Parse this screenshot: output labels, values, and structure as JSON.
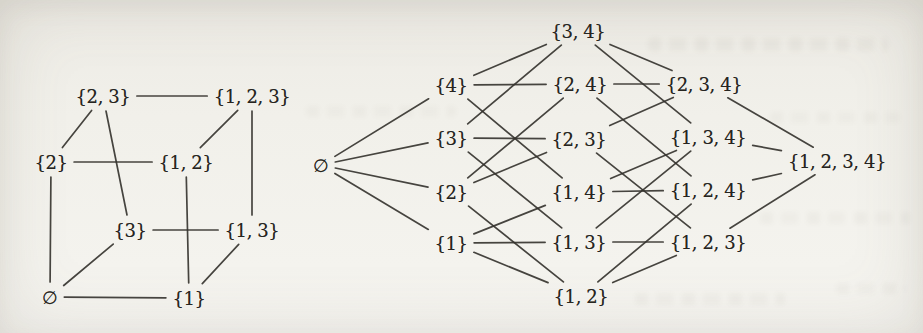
{
  "colors": {
    "paper": "#f1f0ea",
    "ink_line": "#34322d",
    "ink_text": "#262420"
  },
  "left_diagram": {
    "description_name": "powerset-of-1-2-3-cube-hasse-diagram",
    "nodes": [
      {
        "id": "c0",
        "label": "∅",
        "x": 50,
        "y": 297
      },
      {
        "id": "c1",
        "label": "{1}",
        "x": 189,
        "y": 298
      },
      {
        "id": "c2",
        "label": "{2}",
        "x": 51,
        "y": 162
      },
      {
        "id": "c3",
        "label": "{3}",
        "x": 130,
        "y": 230
      },
      {
        "id": "c12",
        "label": "{1, 2}",
        "x": 186,
        "y": 162
      },
      {
        "id": "c13",
        "label": "{1, 3}",
        "x": 252,
        "y": 230
      },
      {
        "id": "c23",
        "label": "{2, 3}",
        "x": 103,
        "y": 96
      },
      {
        "id": "c123",
        "label": "{1, 2, 3}",
        "x": 252,
        "y": 96
      }
    ],
    "edges": [
      [
        "c0",
        "c1"
      ],
      [
        "c0",
        "c2"
      ],
      [
        "c0",
        "c3"
      ],
      [
        "c1",
        "c12"
      ],
      [
        "c1",
        "c13"
      ],
      [
        "c2",
        "c12"
      ],
      [
        "c2",
        "c23"
      ],
      [
        "c3",
        "c13"
      ],
      [
        "c3",
        "c23"
      ],
      [
        "c12",
        "c123"
      ],
      [
        "c13",
        "c123"
      ],
      [
        "c23",
        "c123"
      ]
    ]
  },
  "right_diagram": {
    "description_name": "powerset-of-1-2-3-4-hasse-diagram",
    "nodes": [
      {
        "id": "e",
        "label": "∅",
        "x": 21,
        "y": 165
      },
      {
        "id": "s4",
        "label": "{4}",
        "x": 151,
        "y": 85
      },
      {
        "id": "s3",
        "label": "{3}",
        "x": 151,
        "y": 138
      },
      {
        "id": "s2",
        "label": "{2}",
        "x": 151,
        "y": 192
      },
      {
        "id": "s1",
        "label": "{1}",
        "x": 151,
        "y": 243
      },
      {
        "id": "p34",
        "label": "{3, 4}",
        "x": 278,
        "y": 31
      },
      {
        "id": "p24",
        "label": "{2, 4}",
        "x": 280,
        "y": 84
      },
      {
        "id": "p23",
        "label": "{2, 3}",
        "x": 279,
        "y": 139
      },
      {
        "id": "p14",
        "label": "{1, 4}",
        "x": 279,
        "y": 192
      },
      {
        "id": "p13",
        "label": "{1, 3}",
        "x": 279,
        "y": 242
      },
      {
        "id": "p12",
        "label": "{1, 2}",
        "x": 281,
        "y": 296
      },
      {
        "id": "t234",
        "label": "{2, 3, 4}",
        "x": 404,
        "y": 84
      },
      {
        "id": "t134",
        "label": "{1, 3, 4}",
        "x": 408,
        "y": 137
      },
      {
        "id": "t124",
        "label": "{1, 2, 4}",
        "x": 408,
        "y": 190
      },
      {
        "id": "t123",
        "label": "{1, 2, 3}",
        "x": 408,
        "y": 242
      },
      {
        "id": "f",
        "label": "{1, 2, 3, 4}",
        "x": 537,
        "y": 161
      }
    ],
    "edges": [
      [
        "e",
        "s1"
      ],
      [
        "e",
        "s2"
      ],
      [
        "e",
        "s3"
      ],
      [
        "e",
        "s4"
      ],
      [
        "s1",
        "p12"
      ],
      [
        "s1",
        "p13"
      ],
      [
        "s1",
        "p14"
      ],
      [
        "s2",
        "p12"
      ],
      [
        "s2",
        "p23"
      ],
      [
        "s2",
        "p24"
      ],
      [
        "s3",
        "p13"
      ],
      [
        "s3",
        "p23"
      ],
      [
        "s3",
        "p34"
      ],
      [
        "s4",
        "p14"
      ],
      [
        "s4",
        "p24"
      ],
      [
        "s4",
        "p34"
      ],
      [
        "p12",
        "t123"
      ],
      [
        "p12",
        "t124"
      ],
      [
        "p13",
        "t123"
      ],
      [
        "p13",
        "t134"
      ],
      [
        "p14",
        "t124"
      ],
      [
        "p14",
        "t134"
      ],
      [
        "p23",
        "t123"
      ],
      [
        "p23",
        "t234"
      ],
      [
        "p24",
        "t124"
      ],
      [
        "p24",
        "t234"
      ],
      [
        "p34",
        "t134"
      ],
      [
        "p34",
        "t234"
      ],
      [
        "t123",
        "f"
      ],
      [
        "t124",
        "f"
      ],
      [
        "t134",
        "f"
      ],
      [
        "t234",
        "f"
      ]
    ]
  }
}
